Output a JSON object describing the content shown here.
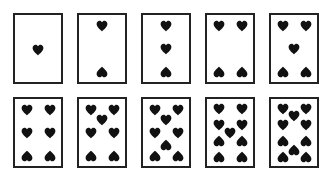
{
  "layout": {
    "card_left": [
      13,
      77,
      141,
      205,
      269
    ],
    "row_top": [
      13,
      97
    ],
    "pip_color": "#111111",
    "border_color": "#222222"
  },
  "cards": [
    {
      "rank": 1,
      "suit": "hearts",
      "pips": [
        [
          23,
          35,
          0
        ]
      ]
    },
    {
      "rank": 2,
      "suit": "hearts",
      "pips": [
        [
          23,
          11,
          0
        ],
        [
          23,
          57,
          1
        ]
      ]
    },
    {
      "rank": 3,
      "suit": "hearts",
      "pips": [
        [
          23,
          11,
          0
        ],
        [
          23,
          34,
          0
        ],
        [
          23,
          57,
          1
        ]
      ]
    },
    {
      "rank": 4,
      "suit": "hearts",
      "pips": [
        [
          12,
          11,
          0
        ],
        [
          35,
          11,
          0
        ],
        [
          12,
          57,
          1
        ],
        [
          35,
          57,
          1
        ]
      ]
    },
    {
      "rank": 5,
      "suit": "hearts",
      "pips": [
        [
          12,
          11,
          0
        ],
        [
          35,
          11,
          0
        ],
        [
          23,
          34,
          0
        ],
        [
          12,
          57,
          1
        ],
        [
          35,
          57,
          1
        ]
      ]
    },
    {
      "rank": 6,
      "suit": "hearts",
      "pips": [
        [
          12,
          11,
          0
        ],
        [
          35,
          11,
          0
        ],
        [
          12,
          34,
          0
        ],
        [
          35,
          34,
          0
        ],
        [
          12,
          57,
          1
        ],
        [
          35,
          57,
          1
        ]
      ]
    },
    {
      "rank": 7,
      "suit": "hearts",
      "pips": [
        [
          12,
          11,
          0
        ],
        [
          35,
          11,
          0
        ],
        [
          23,
          21,
          0
        ],
        [
          12,
          34,
          0
        ],
        [
          35,
          34,
          0
        ],
        [
          12,
          57,
          1
        ],
        [
          35,
          57,
          1
        ]
      ]
    },
    {
      "rank": 8,
      "suit": "hearts",
      "pips": [
        [
          12,
          11,
          0
        ],
        [
          35,
          11,
          0
        ],
        [
          23,
          21,
          0
        ],
        [
          12,
          34,
          0
        ],
        [
          35,
          34,
          0
        ],
        [
          23,
          46,
          1
        ],
        [
          12,
          57,
          1
        ],
        [
          35,
          57,
          1
        ]
      ]
    },
    {
      "rank": 9,
      "suit": "hearts",
      "pips": [
        [
          12,
          10,
          0
        ],
        [
          35,
          10,
          0
        ],
        [
          12,
          26,
          0
        ],
        [
          35,
          26,
          0
        ],
        [
          23,
          34,
          0
        ],
        [
          12,
          42,
          1
        ],
        [
          35,
          42,
          1
        ],
        [
          12,
          58,
          1
        ],
        [
          35,
          58,
          1
        ]
      ]
    },
    {
      "rank": 10,
      "suit": "hearts",
      "pips": [
        [
          12,
          10,
          0
        ],
        [
          35,
          10,
          0
        ],
        [
          23,
          17,
          0
        ],
        [
          12,
          26,
          0
        ],
        [
          35,
          26,
          0
        ],
        [
          12,
          42,
          1
        ],
        [
          35,
          42,
          1
        ],
        [
          23,
          51,
          1
        ],
        [
          12,
          58,
          1
        ],
        [
          35,
          58,
          1
        ]
      ]
    }
  ]
}
